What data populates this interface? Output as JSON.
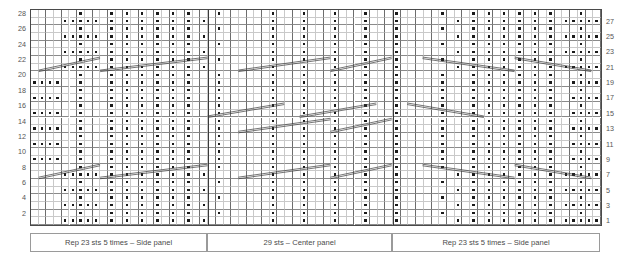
{
  "chart_data": {
    "type": "heatmap",
    "xlabel": "",
    "ylabel": "",
    "grid": true,
    "legend_position": "bottom",
    "rows": 28,
    "columns": 74,
    "symbol_legend": [
      {
        "symbol": "dot",
        "meaning": "purl stitch"
      },
      {
        "symbol": "blank",
        "meaning": "knit stitch"
      },
      {
        "symbol": "diagonal-line",
        "meaning": "cable / travelling stitch crossing"
      }
    ],
    "row_numbers_left": [
      28,
      26,
      24,
      22,
      20,
      18,
      16,
      14,
      12,
      10,
      8,
      6,
      4,
      2
    ],
    "row_numbers_right": [
      27,
      25,
      23,
      21,
      19,
      17,
      15,
      13,
      11,
      9,
      7,
      5,
      3,
      1
    ],
    "panels": [
      {
        "id": "left-side-panel",
        "label": "Rep 23 sts 5 times – Side panel",
        "start_col": 0,
        "end_col": 23,
        "stitches": 23
      },
      {
        "id": "center-panel",
        "label": "29 sts – Center panel",
        "start_col": 23,
        "end_col": 47,
        "stitches": 29
      },
      {
        "id": "right-side-panel",
        "label": "Rep 23 sts 5 times – Side panel",
        "start_col": 47,
        "end_col": 74,
        "stitches": 23
      }
    ],
    "dot_map": [
      "....XXXXX.X.X.X.X.X.X.X........X...X...X...X...X.......X.X.X.X.X.X.X.XXXXX",
      "......X...X.X.X.X.X.X...X......X...X...X...X...X.....X...X.X.X.X.X.X...X..",
      "....XXXXX.X.X.X.X.X.X.X........X...X...X...X...X.......X.X.X.X.X.X.X.XXXXX",
      "......X...X.X.X.X.X.X...X......X...X...X...X...X.....X...X.X.X.X.X.X...X..",
      "....XXXXX.X.X.X.X.X.X.X........X...X...X...X...X.......X.X.X.X.X.X.X.XXXXX",
      "......X...X.X.X.X.X.X...X......X...X...X...X...X.....X...X.X.X.X.X.X...X..",
      "....XXXXX.X.X.X.X.X.X.X........X...X...X...X...X.......X.X.X.X.X.X.X.XXXXX",
      "......X...X.X.X.X.X.X...X......X...X...X...X...X.....X...X.X.X.X.X.X...X..",
      "XXXX..X...X.X.X.X.X.X...X......X...X...X...X...X.....X...X.X.X.X.X.X..XXXX",
      "......X...X.X.X.X.X.X...X......X...X...X...X...X.....X...X.X.X.X.X.X...X..",
      "XXXX..X...X.X.X.X.X.X...X......X...X...X...X...X.....X...X.X.X.X.X.X..XXXX",
      "......X...X.X.X.X.X.X...X......X...X...X...X...X.....X...X.X.X.X.X.X...X..",
      "XXXX..X...X.X.X.X.X.X...X......X...X...X...X...X.....X...X.X.X.X.X.X..XXXX",
      "......X...X.X.X.X.X.X...X......X...X...X...X...X.....X...X.X.X.X.X.X...X..",
      "XXXX..X...X.X.X.X.X.X...X......X...X...X...X...X.....X...X.X.X.X.X.X..XXXX",
      "......X...X.X.X.X.X.X...X......X...X...X...X...X.....X...X.X.X.X.X.X...X..",
      "XXXX..X...X.X.X.X.X.X...X......X...X...X...X...X.....X...X.X.X.X.X.X..XXXX",
      "......X...X.X.X.X.X.X...X......X...X...X...X...X.....X...X.X.X.X.X.X...X..",
      "XXXX..X...X.X.X.X.X.X...X......X...X...X...X...X.....X...X.X.X.X.X.X..XXXX",
      "......X...X.X.X.X.X.X...X......X...X...X...X...X.....X...X.X.X.X.X.X...X..",
      "....XXXXX.X.X.X.X.X.X.X........X...X...X...X...X.......X.X.X.X.X.X.X.XXXXX",
      "......X...X.X.X.X.X.X...X......X...X...X...X...X.....X...X.X.X.X.X.X...X..",
      "....XXXXX.X.X.X.X.X.X.X........X...X...X...X...X.......X.X.X.X.X.X.X.XXXXX",
      "......X...X.X.X.X.X.X...X......X...X...X...X...X.....X...X.X.X.X.X.X...X..",
      "....XXXXX.X.X.X.X.X.X.X........X...X...X...X...X.......X.X.X.X.X.X.X.XXXXX",
      "......X...X.X.X.X.X.X...X......X...X...X...X...X.....X...X.X.X.X.X.X...X..",
      "....XXXXX.X.X.X.X.X.X.X........X...X...X...X...X.......X.X.X.X.X.X.X.XXXXX",
      "......X...X.X.X.X.X.X...X......X...X...X...X...X.....X...X.X.X.X.X.X...X.."
    ],
    "cables": [
      {
        "row": 7,
        "col_start": 1,
        "col_end": 9,
        "dir": "up"
      },
      {
        "row": 7,
        "col_start": 9,
        "col_end": 23,
        "dir": "up"
      },
      {
        "row": 7,
        "col_start": 27,
        "col_end": 39,
        "dir": "up"
      },
      {
        "row": 7,
        "col_start": 39,
        "col_end": 47,
        "dir": "up"
      },
      {
        "row": 7,
        "col_start": 51,
        "col_end": 63,
        "dir": "down"
      },
      {
        "row": 7,
        "col_start": 63,
        "col_end": 73,
        "dir": "down"
      },
      {
        "row": 13,
        "col_start": 27,
        "col_end": 39,
        "dir": "up"
      },
      {
        "row": 13,
        "col_start": 39,
        "col_end": 47,
        "dir": "up"
      },
      {
        "row": 15,
        "col_start": 23,
        "col_end": 33,
        "dir": "up"
      },
      {
        "row": 15,
        "col_start": 35,
        "col_end": 45,
        "dir": "up"
      },
      {
        "row": 15,
        "col_start": 49,
        "col_end": 59,
        "dir": "down"
      },
      {
        "row": 21,
        "col_start": 1,
        "col_end": 9,
        "dir": "up"
      },
      {
        "row": 21,
        "col_start": 9,
        "col_end": 23,
        "dir": "up"
      },
      {
        "row": 21,
        "col_start": 27,
        "col_end": 39,
        "dir": "up"
      },
      {
        "row": 21,
        "col_start": 39,
        "col_end": 47,
        "dir": "up"
      },
      {
        "row": 21,
        "col_start": 51,
        "col_end": 63,
        "dir": "down"
      },
      {
        "row": 21,
        "col_start": 63,
        "col_end": 73,
        "dir": "down"
      }
    ],
    "colors": {
      "grid_minor": "#c9c9c9",
      "grid_major": "#6d6d6d",
      "border": "#4a4a4a",
      "symbol": "#1a1a1a",
      "text": "#4a4a4a",
      "background": "#ffffff"
    }
  },
  "legend_boxes": [
    {
      "label": "Rep 23 sts 5 times – Side panel"
    },
    {
      "label": "29 sts – Center panel"
    },
    {
      "label": "Rep 23 sts 5 times – Side panel"
    }
  ]
}
